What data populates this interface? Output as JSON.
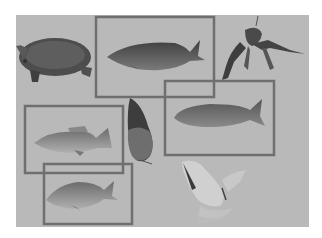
{
  "image": {
    "description": "Grayscale composite of aquatic animals on a gray background with rectangular bounding boxes drawn around four fish",
    "background_color": "#b9b9b9",
    "page_color": "#ffffff",
    "box_color": "#6f6f6f",
    "panel": {
      "x": 16,
      "y": 15,
      "w": 293,
      "h": 212
    }
  },
  "objects": [
    {
      "label": "turtle",
      "boxed": false
    },
    {
      "label": "fish",
      "boxed": true,
      "box": {
        "x": 95,
        "y": 16,
        "w": 120,
        "h": 82
      }
    },
    {
      "label": "crayfish",
      "boxed": false
    },
    {
      "label": "fish",
      "boxed": true,
      "box": {
        "x": 164,
        "y": 80,
        "w": 111,
        "h": 76
      }
    },
    {
      "label": "fish",
      "boxed": true,
      "box": {
        "x": 24,
        "y": 105,
        "w": 100,
        "h": 69
      }
    },
    {
      "label": "fish-vertical",
      "boxed": false
    },
    {
      "label": "fish",
      "boxed": true,
      "box": {
        "x": 43,
        "y": 163,
        "w": 90,
        "h": 62
      }
    },
    {
      "label": "frog",
      "boxed": false
    }
  ]
}
